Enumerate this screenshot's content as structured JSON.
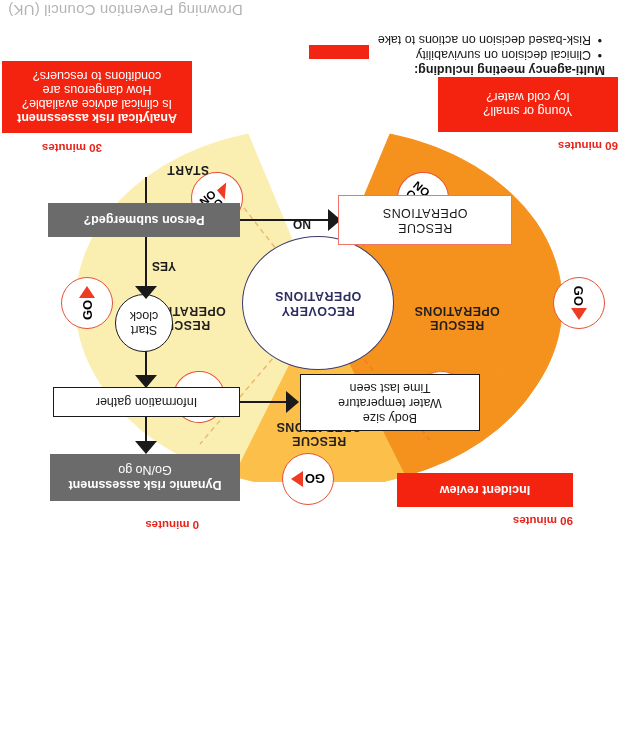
{
  "caption": "Drowning Prevention Council (UK)",
  "legend": {
    "title": "Multi-agency meeting including:",
    "items": [
      "Clinical decision on survivability",
      "Risk-based decision on actions to take"
    ],
    "swatch_color": "#f22413",
    "swatch_name": "red-marker-swatch"
  },
  "wheel": {
    "core_label": "RECOVERY\nOPERATIONS",
    "wedges": [
      {
        "label": "RESCUE\nOPERATIONS",
        "color": "#f5921e",
        "position": "left"
      },
      {
        "label": "RESCUE\nOPERATIONS",
        "color": "#fcbf49",
        "position": "top"
      },
      {
        "label": "RESCUE\nOPERATIONS",
        "color": "#faeeb0",
        "position": "right"
      }
    ],
    "badges": [
      {
        "id": "top",
        "label": "GO",
        "type": "go"
      },
      {
        "id": "left",
        "label": "GO",
        "type": "go"
      },
      {
        "id": "right",
        "label": "GO",
        "type": "go"
      },
      {
        "id": "upper-left",
        "label": "NO GO",
        "type": "nogo"
      },
      {
        "id": "upper-right",
        "label": "NO GO",
        "type": "nogo"
      },
      {
        "id": "lower-left",
        "label": "NO GO",
        "type": "nogo"
      },
      {
        "id": "lower-right",
        "label": "NO GO",
        "type": "nogo"
      }
    ]
  },
  "timeline": {
    "t0": "0 minutes",
    "t30": "30 minutes",
    "t60": "60 minutes",
    "t90": "90 minutes"
  },
  "boxes": {
    "analytical_title": "Analytical risk assessment",
    "analytical_l1": "Is clinical advice available?",
    "analytical_l2": "How dangerous are",
    "analytical_l3": "conditions to rescuers?",
    "young_l1": "Young or small?",
    "young_l2": "Icy cold water?",
    "incident_review": "Incident review",
    "dynamic_title": "Dynamic risk assessment",
    "dynamic_sub": "Go/No go",
    "information_gather": "Information gather",
    "facts_l1": "Body size",
    "facts_l2": "Water temperature",
    "facts_l3": "Time last seen",
    "start_clock_l1": "Start",
    "start_clock_l2": "clock",
    "person_submerged": "Person submerged?",
    "rescue_operations": "RESCUE\nOPERATIONS"
  },
  "flow": {
    "start": "START",
    "yes": "YES",
    "no": "NO"
  },
  "colors": {
    "red": "#f4230f",
    "orange": "#f5921e",
    "gold": "#fcbf49",
    "pale": "#faeeb0",
    "grey": "#6b6b6b",
    "navy": "#2e2e63"
  }
}
